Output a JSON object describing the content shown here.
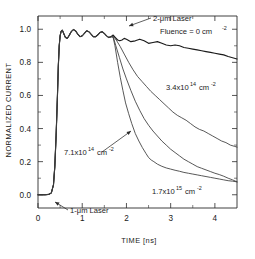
{
  "chart_data": {
    "type": "line",
    "title": "",
    "xlabel": "TIME [ns]",
    "ylabel": "NORMALIZED CURRENT",
    "xlim": [
      0,
      4.5
    ],
    "ylim": [
      -0.08,
      1.08
    ],
    "xticks": [
      0,
      1,
      2,
      3,
      4
    ],
    "xticklabels": [
      "0",
      "1",
      "2",
      "3",
      "4"
    ],
    "yticks": [
      0.0,
      0.2,
      0.4,
      0.6,
      0.8,
      1.0
    ],
    "yticklabels": [
      "0.0",
      "0.2",
      "0.4",
      "0.6",
      "0.8",
      "1.0"
    ],
    "xminor": [
      0.5,
      1.5,
      2.5,
      3.5
    ],
    "yminor": [
      0.1,
      0.3,
      0.5,
      0.7,
      0.9
    ],
    "grid": false,
    "legend": "none",
    "annotations_inside": true,
    "series": [
      {
        "name": "Fluence = 0 cm^-2",
        "label": "Fluence = 0 cm",
        "label_exponent": "-2",
        "x": [
          0.0,
          0.08,
          0.16,
          0.24,
          0.3,
          0.35,
          0.38,
          0.41,
          0.44,
          0.46,
          0.48,
          0.5,
          0.52,
          0.55,
          0.58,
          0.62,
          0.66,
          0.7,
          0.75,
          0.8,
          0.85,
          0.9,
          0.95,
          1.0,
          1.05,
          1.1,
          1.15,
          1.2,
          1.25,
          1.3,
          1.35,
          1.4,
          1.45,
          1.5,
          1.55,
          1.6,
          1.65,
          1.7,
          1.75,
          1.8,
          1.85,
          1.9,
          1.95,
          2.0,
          2.1,
          2.2,
          2.3,
          2.4,
          2.5,
          2.6,
          2.7,
          2.8,
          2.9,
          3.0,
          3.1,
          3.2,
          3.3,
          3.4,
          3.5,
          3.6,
          3.7,
          3.8,
          3.9,
          4.0,
          4.1,
          4.2,
          4.3,
          4.4,
          4.5
        ],
        "y": [
          0.0,
          0.0,
          0.0,
          0.002,
          0.01,
          0.06,
          0.17,
          0.36,
          0.6,
          0.78,
          0.9,
          0.96,
          0.985,
          0.995,
          0.975,
          0.95,
          0.945,
          0.96,
          0.985,
          0.998,
          0.99,
          0.97,
          0.955,
          0.96,
          0.975,
          0.99,
          0.985,
          0.97,
          0.955,
          0.955,
          0.965,
          0.98,
          0.985,
          0.975,
          0.96,
          0.95,
          0.955,
          0.965,
          0.95,
          0.935,
          0.93,
          0.935,
          0.945,
          0.94,
          0.925,
          0.93,
          0.94,
          0.93,
          0.915,
          0.92,
          0.925,
          0.915,
          0.905,
          0.9,
          0.905,
          0.9,
          0.89,
          0.885,
          0.88,
          0.875,
          0.87,
          0.865,
          0.86,
          0.855,
          0.85,
          0.845,
          0.835,
          0.828,
          0.82
        ]
      },
      {
        "name": "3.4x10^14 cm^-2",
        "label": "3.4x10",
        "label_exponent": "14",
        "label_unit": "cm",
        "label_unit_exponent": "-2",
        "x": [
          0.0,
          0.08,
          0.16,
          0.24,
          0.3,
          0.35,
          0.38,
          0.41,
          0.44,
          0.46,
          0.48,
          0.5,
          0.52,
          0.55,
          0.58,
          0.62,
          0.66,
          0.7,
          0.75,
          0.8,
          0.85,
          0.9,
          0.95,
          1.0,
          1.05,
          1.1,
          1.15,
          1.2,
          1.25,
          1.3,
          1.35,
          1.4,
          1.45,
          1.5,
          1.55,
          1.6,
          1.65,
          1.7,
          1.78,
          1.86,
          1.95,
          2.05,
          2.15,
          2.25,
          2.35,
          2.45,
          2.55,
          2.65,
          2.75,
          2.85,
          2.95,
          3.05,
          3.15,
          3.25,
          3.35,
          3.45,
          3.55,
          3.65,
          3.75,
          3.85,
          3.95,
          4.05,
          4.15,
          4.25,
          4.35,
          4.45,
          4.5
        ],
        "y": [
          0.0,
          0.0,
          0.0,
          0.002,
          0.01,
          0.06,
          0.17,
          0.36,
          0.6,
          0.78,
          0.9,
          0.96,
          0.985,
          0.995,
          0.975,
          0.95,
          0.945,
          0.96,
          0.985,
          0.998,
          0.99,
          0.97,
          0.955,
          0.96,
          0.975,
          0.99,
          0.985,
          0.97,
          0.955,
          0.955,
          0.965,
          0.98,
          0.985,
          0.975,
          0.96,
          0.95,
          0.955,
          0.96,
          0.93,
          0.895,
          0.85,
          0.8,
          0.755,
          0.715,
          0.685,
          0.655,
          0.625,
          0.6,
          0.575,
          0.55,
          0.525,
          0.5,
          0.48,
          0.465,
          0.45,
          0.43,
          0.41,
          0.395,
          0.385,
          0.37,
          0.355,
          0.34,
          0.325,
          0.315,
          0.3,
          0.292,
          0.288
        ]
      },
      {
        "name": "7.1x10^14 cm^-2",
        "label": "7.1x10",
        "label_exponent": "14",
        "label_unit": "cm",
        "label_unit_exponent": "-2",
        "x": [
          0.0,
          0.08,
          0.16,
          0.24,
          0.3,
          0.35,
          0.38,
          0.41,
          0.44,
          0.46,
          0.48,
          0.5,
          0.52,
          0.55,
          0.58,
          0.62,
          0.66,
          0.7,
          0.75,
          0.8,
          0.85,
          0.9,
          0.95,
          1.0,
          1.05,
          1.1,
          1.15,
          1.2,
          1.25,
          1.3,
          1.35,
          1.4,
          1.45,
          1.5,
          1.55,
          1.6,
          1.65,
          1.7,
          1.76,
          1.84,
          1.92,
          2.0,
          2.1,
          2.2,
          2.3,
          2.4,
          2.5,
          2.6,
          2.7,
          2.8,
          2.9,
          3.0,
          3.1,
          3.2,
          3.3,
          3.4,
          3.5,
          3.6,
          3.7,
          3.8,
          3.9,
          4.0,
          4.1,
          4.2,
          4.3,
          4.4,
          4.5
        ],
        "y": [
          0.0,
          0.0,
          0.0,
          0.002,
          0.01,
          0.06,
          0.17,
          0.36,
          0.6,
          0.78,
          0.9,
          0.96,
          0.985,
          0.995,
          0.975,
          0.95,
          0.945,
          0.96,
          0.985,
          0.998,
          0.99,
          0.97,
          0.955,
          0.96,
          0.975,
          0.99,
          0.985,
          0.97,
          0.955,
          0.955,
          0.965,
          0.98,
          0.985,
          0.975,
          0.96,
          0.95,
          0.955,
          0.955,
          0.9,
          0.83,
          0.76,
          0.7,
          0.63,
          0.565,
          0.51,
          0.46,
          0.42,
          0.385,
          0.355,
          0.325,
          0.3,
          0.275,
          0.255,
          0.235,
          0.215,
          0.2,
          0.185,
          0.17,
          0.16,
          0.15,
          0.14,
          0.13,
          0.122,
          0.112,
          0.1,
          0.09,
          0.078
        ]
      },
      {
        "name": "1.7x10^15 cm^-2",
        "label": "1.7x10",
        "label_exponent": "15",
        "label_unit": "cm",
        "label_unit_exponent": "-2",
        "x": [
          0.0,
          0.08,
          0.16,
          0.24,
          0.3,
          0.35,
          0.38,
          0.41,
          0.44,
          0.46,
          0.48,
          0.5,
          0.52,
          0.55,
          0.58,
          0.62,
          0.66,
          0.7,
          0.75,
          0.8,
          0.85,
          0.9,
          0.95,
          1.0,
          1.05,
          1.1,
          1.15,
          1.2,
          1.25,
          1.3,
          1.35,
          1.4,
          1.45,
          1.5,
          1.55,
          1.6,
          1.65,
          1.7,
          1.74,
          1.8,
          1.86,
          1.92,
          1.98,
          2.05,
          2.12,
          2.2,
          2.28,
          2.36,
          2.44,
          2.5,
          2.56,
          2.62,
          2.7,
          2.8,
          2.9,
          3.0,
          3.1,
          3.2,
          3.3,
          3.4,
          3.5,
          3.6,
          3.7,
          3.8,
          3.9,
          4.0,
          4.1,
          4.2,
          4.3,
          4.4,
          4.5
        ],
        "y": [
          0.0,
          0.0,
          0.0,
          0.002,
          0.01,
          0.06,
          0.17,
          0.36,
          0.6,
          0.78,
          0.9,
          0.96,
          0.985,
          0.995,
          0.975,
          0.95,
          0.945,
          0.96,
          0.985,
          0.998,
          0.99,
          0.97,
          0.955,
          0.96,
          0.975,
          0.99,
          0.985,
          0.97,
          0.955,
          0.955,
          0.965,
          0.98,
          0.985,
          0.975,
          0.96,
          0.95,
          0.955,
          0.95,
          0.9,
          0.8,
          0.71,
          0.63,
          0.555,
          0.49,
          0.43,
          0.37,
          0.325,
          0.285,
          0.25,
          0.225,
          0.21,
          0.2,
          0.185,
          0.172,
          0.162,
          0.155,
          0.148,
          0.142,
          0.135,
          0.13,
          0.125,
          0.12,
          0.115,
          0.11,
          0.105,
          0.1,
          0.095,
          0.09,
          0.085,
          0.082,
          0.078
        ]
      }
    ],
    "annotations": [
      {
        "id": "two-um-laser",
        "text": "2-μm Laser",
        "x": 2.05,
        "y": 1.035
      },
      {
        "id": "one-um-laser",
        "text": "1-μm Laser",
        "x": 0.78,
        "y": -0.062
      }
    ]
  },
  "labels": {
    "two_um_laser": "2-μm Laser",
    "one_um_laser": "1-μm Laser",
    "fluence_zero": "Fluence = 0 cm",
    "fluence_zero_exp": "-2",
    "f34_mant": "3.4x10",
    "f34_exp": "14",
    "f34_unit": "cm",
    "f34_unit_exp": "-2",
    "f71_mant": "7.1x10",
    "f71_exp": "14",
    "f71_unit": "cm",
    "f71_unit_exp": "-2",
    "f17_mant": "1.7x10",
    "f17_exp": "15",
    "f17_unit": "cm",
    "f17_unit_exp": "-2"
  }
}
